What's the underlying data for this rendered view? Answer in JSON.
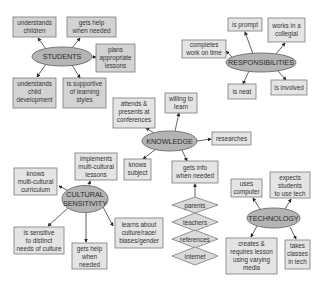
{
  "colors": {
    "background": "#ffffff",
    "box_fill": "#d3d3d3",
    "box_light_fill": "#e4e4e4",
    "hub_fill": "#b4b4b4",
    "border": "#7a7a7a",
    "text": "#333333"
  },
  "students": {
    "hub": "STUDENTS",
    "nodes": [
      [
        "understands",
        "children"
      ],
      [
        "gets help",
        "when needed"
      ],
      [
        "plans",
        "appropriate",
        "lessons"
      ],
      [
        "understands",
        "child",
        "development"
      ],
      [
        "is supportive",
        "of learning",
        "styles"
      ]
    ]
  },
  "responsibilities": {
    "hub": "RESPONSIBILITIES",
    "nodes": [
      [
        "is prompt"
      ],
      [
        "works in a",
        "collegial"
      ],
      [
        "completes",
        "work on time"
      ],
      [
        "is neat"
      ],
      [
        "is involved"
      ]
    ]
  },
  "knowledge": {
    "hub": "KNOWLEDGE",
    "nodes": [
      [
        "attends &",
        "presents at",
        "conferences"
      ],
      [
        "willing to",
        "learn"
      ],
      [
        "researches"
      ],
      [
        "knows",
        "subject"
      ],
      [
        "gets info",
        "when needed"
      ]
    ],
    "sources": [
      "parents",
      "teachers",
      "references",
      "internet"
    ]
  },
  "cultural": {
    "hub": [
      "CULTURAL",
      "SENSITIVITY"
    ],
    "nodes": [
      [
        "implements",
        "multi-cultural",
        "lessons"
      ],
      [
        "knows",
        "multi-cultural",
        "curriculum"
      ],
      [
        "is sensitive",
        "to distinct",
        "needs of culture"
      ],
      [
        "gets help",
        "when",
        "needed"
      ],
      [
        "learns about",
        "culture/race/",
        "biases/gender"
      ]
    ]
  },
  "technology": {
    "hub": "TECHNOLOGY",
    "nodes": [
      [
        "uses",
        "computer"
      ],
      [
        "expects",
        "students",
        "to use tech"
      ],
      [
        "creates &",
        "requires lesson",
        "using varying",
        "media"
      ],
      [
        "takes",
        "classes",
        "in tech"
      ]
    ]
  }
}
